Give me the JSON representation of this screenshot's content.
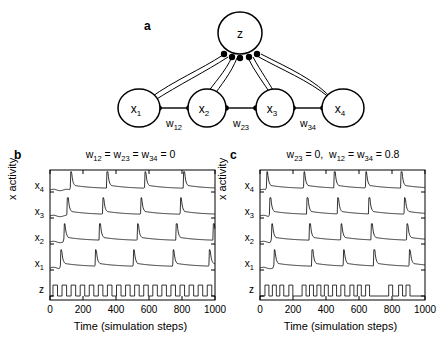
{
  "panels": {
    "a": {
      "label": "a",
      "center_node": "z",
      "nodes": [
        "x",
        "x",
        "x",
        "x"
      ],
      "node_labels": [
        "x1",
        "x2",
        "x3",
        "x4"
      ],
      "node_sub": [
        "1",
        "2",
        "3",
        "4"
      ],
      "node_base": "x",
      "center_label": "z",
      "weight_labels": [
        "w12",
        "w23",
        "w34"
      ],
      "weight_base": "w",
      "weight_subs": [
        "12",
        "23",
        "34"
      ]
    },
    "b": {
      "label": "b",
      "title": "w12 = w23 = w34 = 0",
      "title_parts": [
        {
          "base": "w",
          "sub": "12"
        },
        {
          "base": "w",
          "sub": "23"
        },
        {
          "base": "w",
          "sub": "34"
        }
      ],
      "title_tail": "= 0"
    },
    "c": {
      "label": "c",
      "title": "w23 = 0,  w12 = w34 = 0.8",
      "title_parts": [
        {
          "base": "w",
          "sub": "23"
        },
        {
          "base": "w",
          "sub": "12"
        },
        {
          "base": "w",
          "sub": "34"
        }
      ],
      "title_mid": "= 0,",
      "title_tail": "= 0.8"
    }
  },
  "axes": {
    "xlabel": "Time (simulation steps)",
    "ylabel": "x activity",
    "xticks": [
      "0",
      "200",
      "400",
      "600",
      "800",
      "1000"
    ],
    "xtick_values": [
      0,
      200,
      400,
      600,
      800,
      1000
    ],
    "yticks": [
      "x4",
      "x3",
      "x2",
      "x1",
      "z"
    ],
    "ytick_base": [
      "x",
      "x",
      "x",
      "x",
      "z"
    ],
    "ytick_sub": [
      "4",
      "3",
      "2",
      "1",
      ""
    ],
    "xlim": [
      0,
      1000
    ]
  },
  "chart_data": [
    {
      "type": "line",
      "panel": "b",
      "title": "w12 = w23 = w34 = 0",
      "xlabel": "Time (simulation steps)",
      "ylabel": "x activity",
      "xlim": [
        0,
        1000
      ],
      "grid": false,
      "legend": "none",
      "traces": [
        {
          "name": "x4",
          "row": 0,
          "kind": "spike",
          "spike_times": [
            125,
            345,
            575,
            810
          ],
          "note": "sharp spike with slow decay"
        },
        {
          "name": "x3",
          "row": 1,
          "kind": "spike",
          "spike_times": [
            105,
            320,
            550,
            790
          ]
        },
        {
          "name": "x2",
          "row": 2,
          "kind": "spike",
          "spike_times": [
            85,
            300,
            530,
            765,
            990
          ]
        },
        {
          "name": "x1",
          "row": 3,
          "kind": "spike",
          "spike_times": [
            65,
            275,
            505,
            745,
            965
          ]
        },
        {
          "name": "z",
          "row": 4,
          "kind": "square",
          "period": 55,
          "duty": 0.5,
          "pulses": 18,
          "regular": true
        }
      ]
    },
    {
      "type": "line",
      "panel": "c",
      "title": "w23 = 0,  w12 = w34 = 0.8",
      "xlabel": "Time (simulation steps)",
      "ylabel": "x activity",
      "xlim": [
        0,
        1000
      ],
      "grid": false,
      "legend": "none",
      "traces": [
        {
          "name": "x4",
          "row": 0,
          "kind": "spike",
          "spike_times": [
            40,
            265,
            450,
            640,
            855
          ]
        },
        {
          "name": "x3",
          "row": 1,
          "kind": "spike",
          "spike_times": [
            60,
            285,
            470,
            660,
            875
          ]
        },
        {
          "name": "x2",
          "row": 2,
          "kind": "spike",
          "spike_times": [
            70,
            300,
            490,
            675,
            890
          ]
        },
        {
          "name": "x1",
          "row": 3,
          "kind": "spike",
          "spike_times": [
            85,
            315,
            505,
            690,
            905
          ]
        },
        {
          "name": "z",
          "row": 4,
          "kind": "square",
          "regular": false,
          "pulse_starts": [
            30,
            75,
            120,
            175,
            255,
            300,
            345,
            390,
            440,
            490,
            545,
            590,
            640,
            780,
            840,
            885
          ],
          "pulse_width": 24
        }
      ]
    }
  ],
  "colors": {
    "line": "#000000",
    "frame": "#000000",
    "background": "#ffffff"
  }
}
